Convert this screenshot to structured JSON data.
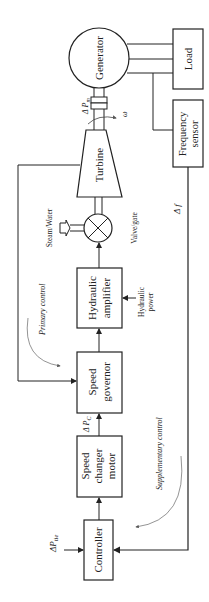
{
  "diagram": {
    "blocks": {
      "generator": "Generator",
      "load": "Load",
      "frequency_sensor_1": "Frequency",
      "frequency_sensor_2": "sensor",
      "turbine": "Turbine",
      "hydraulic_amplifier_1": "Hydraulic",
      "hydraulic_amplifier_2": "amplifier",
      "speed_governor_1": "Speed",
      "speed_governor_2": "governor",
      "speed_changer_1": "Speed",
      "speed_changer_2": "changer",
      "speed_changer_3": "motor",
      "controller": "Controller"
    },
    "labels": {
      "delta_pm": "Δ P",
      "delta_pm_sub": "m",
      "omega": "ω",
      "steam_water": "Steam/Water",
      "valve_gate": "Valve/gate",
      "hydraulic_power_1": "Hydraulic",
      "hydraulic_power_2": "power",
      "primary_control": "Primary control",
      "supplementary_control": "Supplementary control",
      "delta_pc": "Δ P",
      "delta_pc_sub": "C",
      "delta_f": "Δ f",
      "delta_ptie": "ΔP",
      "delta_ptie_sub": "tie"
    }
  }
}
